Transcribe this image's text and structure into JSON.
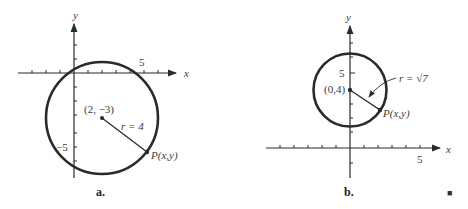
{
  "panels": [
    {
      "id": "a",
      "caption": "a.",
      "x_axis_label": "x",
      "y_axis_label": "y",
      "x_tick_label": "5",
      "y_tick_label": "−5",
      "center_label": "(2, −3)",
      "radius_label": "r = 4",
      "point_label": "P(x,y)",
      "center": [
        2,
        -3
      ],
      "radius": 4
    },
    {
      "id": "b",
      "caption": "b.",
      "x_axis_label": "x",
      "y_axis_label": "y",
      "x_tick_label": "5",
      "y_tick_label": "5",
      "center_label": "(0,4)",
      "radius_label": "r = √7",
      "point_label": "P(x,y)",
      "center": [
        0,
        4
      ],
      "radius": "√7"
    }
  ],
  "end_mark": "■",
  "colors": {
    "stroke": "#2a2a2a",
    "text": "#3a3a3a"
  }
}
